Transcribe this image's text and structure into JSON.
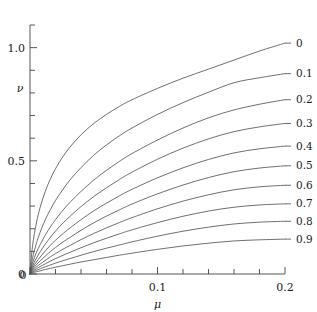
{
  "chart_data": {
    "type": "line",
    "title": "",
    "subtitle": "",
    "xlabel": "μ",
    "ylabel": "ν",
    "xlim": [
      0,
      0.2
    ],
    "ylim": [
      0,
      1.1
    ],
    "grid": false,
    "legend_position": "right-of-curve-ends",
    "x_major_ticks": [
      0,
      0.1,
      0.2
    ],
    "x_major_tick_labels": [
      "0",
      "0.1",
      "0.2"
    ],
    "x_minor_tick_step": 0.02,
    "y_major_ticks": [
      0,
      0.5,
      1.0
    ],
    "y_major_tick_labels": [
      "0",
      "0.5",
      "1.0"
    ],
    "y_minor_tick_step": 0.1,
    "y_axis_top_value": 1.1,
    "series": [
      {
        "name": "0",
        "label": "0",
        "end_value": 1.02,
        "x": [
          0,
          0.002,
          0.005,
          0.008,
          0.012,
          0.016,
          0.02,
          0.026,
          0.032,
          0.04,
          0.05,
          0.06,
          0.07,
          0.08,
          0.1,
          0.12,
          0.14,
          0.16,
          0.18,
          0.2
        ],
        "values": [
          0,
          0.125,
          0.225,
          0.295,
          0.365,
          0.42,
          0.465,
          0.52,
          0.565,
          0.615,
          0.665,
          0.705,
          0.74,
          0.77,
          0.82,
          0.865,
          0.905,
          0.945,
          0.985,
          1.02
        ]
      },
      {
        "name": "0.1",
        "label": "0.1",
        "end_value": 0.885,
        "x": [
          0,
          0.002,
          0.005,
          0.008,
          0.012,
          0.016,
          0.02,
          0.026,
          0.032,
          0.04,
          0.05,
          0.06,
          0.07,
          0.08,
          0.1,
          0.12,
          0.14,
          0.16,
          0.18,
          0.2
        ],
        "values": [
          0,
          0.07,
          0.135,
          0.185,
          0.24,
          0.285,
          0.325,
          0.375,
          0.42,
          0.47,
          0.525,
          0.57,
          0.61,
          0.645,
          0.705,
          0.757,
          0.803,
          0.845,
          0.867,
          0.885
        ]
      },
      {
        "name": "0.2",
        "label": "0.2",
        "end_value": 0.77,
        "x": [
          0,
          0.002,
          0.005,
          0.008,
          0.012,
          0.016,
          0.02,
          0.026,
          0.032,
          0.04,
          0.05,
          0.06,
          0.07,
          0.08,
          0.1,
          0.12,
          0.14,
          0.16,
          0.18,
          0.2
        ],
        "values": [
          0,
          0.048,
          0.095,
          0.13,
          0.172,
          0.208,
          0.24,
          0.283,
          0.32,
          0.365,
          0.415,
          0.458,
          0.497,
          0.532,
          0.592,
          0.645,
          0.69,
          0.725,
          0.75,
          0.77
        ]
      },
      {
        "name": "0.3",
        "label": "0.3",
        "end_value": 0.665,
        "x": [
          0,
          0.002,
          0.005,
          0.008,
          0.012,
          0.016,
          0.02,
          0.026,
          0.032,
          0.04,
          0.05,
          0.06,
          0.07,
          0.08,
          0.1,
          0.12,
          0.14,
          0.16,
          0.18,
          0.2
        ],
        "values": [
          0,
          0.035,
          0.07,
          0.098,
          0.132,
          0.162,
          0.19,
          0.226,
          0.258,
          0.298,
          0.342,
          0.381,
          0.417,
          0.45,
          0.507,
          0.556,
          0.597,
          0.629,
          0.65,
          0.665
        ]
      },
      {
        "name": "0.4",
        "label": "0.4",
        "end_value": 0.565,
        "x": [
          0,
          0.002,
          0.005,
          0.008,
          0.012,
          0.016,
          0.02,
          0.026,
          0.032,
          0.04,
          0.05,
          0.06,
          0.07,
          0.08,
          0.1,
          0.12,
          0.14,
          0.16,
          0.18,
          0.2
        ],
        "values": [
          0,
          0.026,
          0.053,
          0.075,
          0.102,
          0.127,
          0.149,
          0.179,
          0.206,
          0.24,
          0.279,
          0.313,
          0.345,
          0.374,
          0.425,
          0.469,
          0.506,
          0.535,
          0.553,
          0.565
        ]
      },
      {
        "name": "0.5",
        "label": "0.5",
        "end_value": 0.478,
        "x": [
          0,
          0.002,
          0.005,
          0.008,
          0.012,
          0.016,
          0.02,
          0.026,
          0.032,
          0.04,
          0.05,
          0.06,
          0.07,
          0.08,
          0.1,
          0.12,
          0.14,
          0.16,
          0.18,
          0.2
        ],
        "values": [
          0,
          0.02,
          0.041,
          0.058,
          0.079,
          0.099,
          0.117,
          0.142,
          0.164,
          0.193,
          0.226,
          0.256,
          0.283,
          0.309,
          0.354,
          0.393,
          0.426,
          0.452,
          0.468,
          0.478
        ]
      },
      {
        "name": "0.6",
        "label": "0.6",
        "end_value": 0.392,
        "x": [
          0,
          0.002,
          0.005,
          0.008,
          0.012,
          0.016,
          0.02,
          0.026,
          0.032,
          0.04,
          0.05,
          0.06,
          0.07,
          0.08,
          0.1,
          0.12,
          0.14,
          0.16,
          0.18,
          0.2
        ],
        "values": [
          0,
          0.015,
          0.031,
          0.044,
          0.06,
          0.076,
          0.09,
          0.11,
          0.128,
          0.152,
          0.179,
          0.204,
          0.227,
          0.249,
          0.288,
          0.322,
          0.35,
          0.372,
          0.385,
          0.392
        ]
      },
      {
        "name": "0.7",
        "label": "0.7",
        "end_value": 0.31,
        "x": [
          0,
          0.002,
          0.005,
          0.008,
          0.012,
          0.016,
          0.02,
          0.026,
          0.032,
          0.04,
          0.05,
          0.06,
          0.07,
          0.08,
          0.1,
          0.12,
          0.14,
          0.16,
          0.18,
          0.2
        ],
        "values": [
          0,
          0.011,
          0.023,
          0.033,
          0.045,
          0.057,
          0.068,
          0.083,
          0.097,
          0.116,
          0.138,
          0.158,
          0.177,
          0.195,
          0.227,
          0.255,
          0.278,
          0.295,
          0.305,
          0.31
        ]
      },
      {
        "name": "0.8",
        "label": "0.8",
        "end_value": 0.233,
        "x": [
          0,
          0.002,
          0.005,
          0.008,
          0.012,
          0.016,
          0.02,
          0.026,
          0.032,
          0.04,
          0.05,
          0.06,
          0.07,
          0.08,
          0.1,
          0.12,
          0.14,
          0.16,
          0.18,
          0.2
        ],
        "values": [
          0,
          0.008,
          0.016,
          0.023,
          0.032,
          0.04,
          0.048,
          0.059,
          0.069,
          0.083,
          0.099,
          0.114,
          0.128,
          0.142,
          0.167,
          0.189,
          0.207,
          0.221,
          0.229,
          0.233
        ]
      },
      {
        "name": "0.9",
        "label": "0.9",
        "end_value": 0.154,
        "x": [
          0,
          0.002,
          0.005,
          0.008,
          0.012,
          0.016,
          0.02,
          0.026,
          0.032,
          0.04,
          0.05,
          0.06,
          0.07,
          0.08,
          0.1,
          0.12,
          0.14,
          0.16,
          0.18,
          0.2
        ],
        "values": [
          0,
          0.005,
          0.01,
          0.014,
          0.02,
          0.025,
          0.03,
          0.037,
          0.044,
          0.053,
          0.063,
          0.073,
          0.083,
          0.092,
          0.109,
          0.124,
          0.136,
          0.146,
          0.151,
          0.154
        ]
      }
    ]
  },
  "axes": {
    "x_title": "μ",
    "y_title": "ν",
    "x_labels": [
      "0",
      "0.1",
      "0.2"
    ],
    "y_labels": [
      "0",
      "0.5",
      "1.0"
    ]
  },
  "curve_labels": [
    "0",
    "0.1",
    "0.2",
    "0.3",
    "0.4",
    "0.5",
    "0.6",
    "0.7",
    "0.8",
    "0.9"
  ],
  "colors": {
    "background": "#ffffff",
    "axis": "#444444",
    "curve": "#555555",
    "text": "#1a1a1a"
  }
}
